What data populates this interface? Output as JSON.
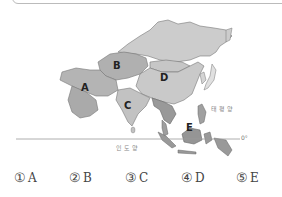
{
  "map": {
    "title": "Asia map",
    "regions": [
      {
        "id": "A",
        "label": "A"
      },
      {
        "id": "B",
        "label": "B"
      },
      {
        "id": "C",
        "label": "C"
      },
      {
        "id": "D",
        "label": "D"
      },
      {
        "id": "E",
        "label": "E"
      }
    ],
    "oceans": {
      "pacific": "태평양",
      "indian": "인도양"
    },
    "equator_label": "0°",
    "colors": {
      "land_light": "#c9c9c9",
      "land_dark": "#a9a9a9",
      "border": "#777777",
      "equator": "#999999"
    }
  },
  "choices": [
    {
      "num": "①",
      "label": "A"
    },
    {
      "num": "②",
      "label": "B"
    },
    {
      "num": "③",
      "label": "C"
    },
    {
      "num": "④",
      "label": "D"
    },
    {
      "num": "⑤",
      "label": "E"
    }
  ]
}
